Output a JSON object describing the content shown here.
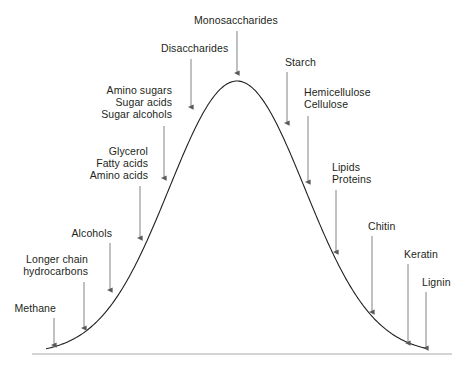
{
  "figure": {
    "type": "annotated-curve",
    "curve_color": "#231f20",
    "axis_color": "#a7a9ac",
    "arrow_color": "#808285",
    "text_color": "#231f20",
    "background": "#ffffff"
  },
  "chart_data": {
    "type": "line",
    "title": "",
    "xlabel": "",
    "ylabel": "",
    "grid": false,
    "legend": "none",
    "baseline_y": 354,
    "curve_peak": {
      "x": 237,
      "y": 81
    },
    "curve_left_base": {
      "x": 46,
      "y": 354
    },
    "curve_right_base": {
      "x": 426,
      "y": 354
    },
    "annotations": [
      {
        "id": "methane",
        "label": "Methane",
        "lines": [
          "Methane"
        ],
        "align": "right",
        "label_x": 14,
        "label_y": 303,
        "label_width": 42,
        "arrow_x": 54,
        "arrow_y_start": 318,
        "arrow_y_end": 345
      },
      {
        "id": "longer-chain-hydrocarbons",
        "label": "Longer chain hydrocarbons",
        "lines": [
          "Longer chain",
          "hydrocarbons"
        ],
        "align": "right",
        "label_x": 16,
        "label_y": 254,
        "label_width": 72,
        "arrow_x": 84,
        "arrow_y_start": 282,
        "arrow_y_end": 328
      },
      {
        "id": "alcohols",
        "label": "Alcohols",
        "lines": [
          "Alcohols"
        ],
        "align": "right",
        "label_x": 70,
        "label_y": 228,
        "label_width": 42,
        "arrow_x": 110,
        "arrow_y_start": 243,
        "arrow_y_end": 290
      },
      {
        "id": "glycerol-fatty-acids-amino-acids",
        "label": "Glycerol Fatty acids Amino acids",
        "lines": [
          "Glycerol",
          "Fatty acids",
          "Amino acids"
        ],
        "align": "right",
        "label_x": 80,
        "label_y": 146,
        "label_width": 68,
        "arrow_x": 140,
        "arrow_y_start": 186,
        "arrow_y_end": 238
      },
      {
        "id": "amino-sugars-sugar-acids-sugar-alcohols",
        "label": "Amino sugars Sugar acids Sugar alcohols",
        "lines": [
          "Amino sugars",
          "Sugar acids",
          "Sugar alcohols"
        ],
        "align": "right",
        "label_x": 90,
        "label_y": 85,
        "label_width": 82,
        "arrow_x": 164,
        "arrow_y_start": 126,
        "arrow_y_end": 178
      },
      {
        "id": "disaccharides",
        "label": "Disaccharides",
        "lines": [
          "Disaccharides"
        ],
        "align": "left",
        "label_x": 161,
        "label_y": 43,
        "label_width": 70,
        "arrow_x": 191,
        "arrow_y_start": 59,
        "arrow_y_end": 107
      },
      {
        "id": "monosaccharides",
        "label": "Monosaccharides",
        "lines": [
          "Monosaccharides"
        ],
        "align": "left",
        "label_x": 194,
        "label_y": 15,
        "label_width": 86,
        "arrow_x": 237,
        "arrow_y_start": 31,
        "arrow_y_end": 73
      },
      {
        "id": "starch",
        "label": "Starch",
        "lines": [
          "Starch"
        ],
        "align": "left",
        "label_x": 285,
        "label_y": 57,
        "label_width": 34,
        "arrow_x": 287,
        "arrow_y_start": 72,
        "arrow_y_end": 123
      },
      {
        "id": "hemicellulose-cellulose",
        "label": "Hemicellulose Cellulose",
        "lines": [
          "Hemicellulose",
          "Cellulose"
        ],
        "align": "left",
        "label_x": 304,
        "label_y": 87,
        "label_width": 74,
        "arrow_x": 308,
        "arrow_y_start": 116,
        "arrow_y_end": 182
      },
      {
        "id": "lipids-proteins",
        "label": "Lipids Proteins",
        "lines": [
          "Lipids",
          "Proteins"
        ],
        "align": "left",
        "label_x": 332,
        "label_y": 162,
        "label_width": 48,
        "arrow_x": 336,
        "arrow_y_start": 190,
        "arrow_y_end": 252
      },
      {
        "id": "chitin",
        "label": "Chitin",
        "lines": [
          "Chitin"
        ],
        "align": "left",
        "label_x": 368,
        "label_y": 221,
        "label_width": 32,
        "arrow_x": 372,
        "arrow_y_start": 236,
        "arrow_y_end": 312
      },
      {
        "id": "keratin",
        "label": "Keratin",
        "lines": [
          "Keratin"
        ],
        "align": "left",
        "label_x": 404,
        "label_y": 249,
        "label_width": 36,
        "arrow_x": 408,
        "arrow_y_start": 264,
        "arrow_y_end": 343
      },
      {
        "id": "lignin",
        "label": "Lignin",
        "lines": [
          "Lignin"
        ],
        "align": "left",
        "label_x": 422,
        "label_y": 277,
        "label_width": 32,
        "arrow_x": 426,
        "arrow_y_start": 292,
        "arrow_y_end": 348
      }
    ]
  }
}
